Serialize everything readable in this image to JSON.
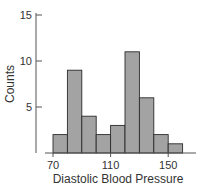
{
  "chart_data": {
    "type": "bar",
    "subtype": "histogram",
    "title": "",
    "xlabel": "Diastolic Blood Pressure",
    "ylabel": "Counts",
    "bin_width": 10,
    "bin_starts": [
      70,
      80,
      90,
      100,
      110,
      120,
      130,
      140,
      150
    ],
    "categories": [
      "70-80",
      "80-90",
      "90-100",
      "100-110",
      "110-120",
      "120-130",
      "130-140",
      "140-150",
      "150-160"
    ],
    "values": [
      2,
      9,
      4,
      2,
      3,
      11,
      6,
      2,
      1
    ],
    "xticks": [
      70,
      110,
      150
    ],
    "yticks": [
      5,
      10,
      15
    ],
    "xlim": [
      66,
      166
    ],
    "ylim": [
      0,
      15.5
    ],
    "grid": false,
    "legend": null,
    "colors": {
      "bar_fill": "#a3a3a3",
      "bar_edge": "#2b2b2b",
      "axis": "#555555"
    }
  }
}
